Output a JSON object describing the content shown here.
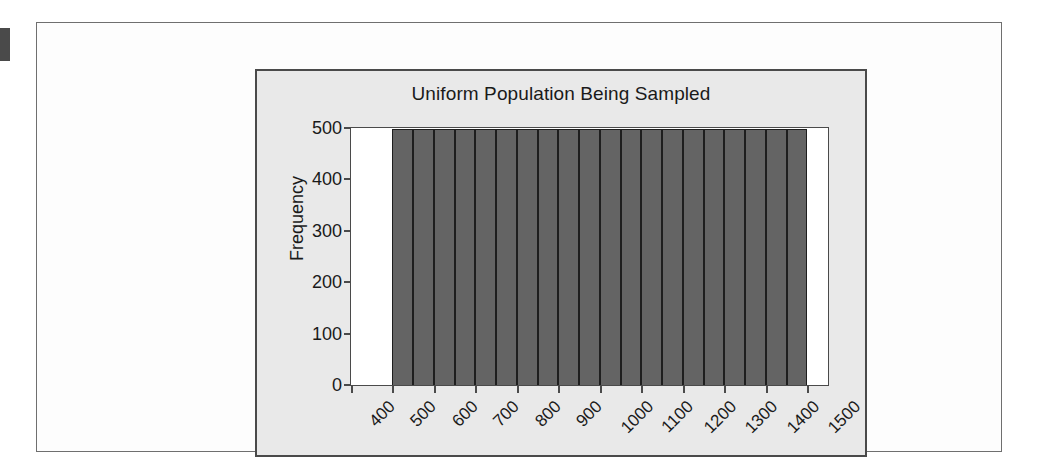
{
  "page": {
    "background_color": "#ffffff",
    "panel_background_color": "#fdfdfd",
    "edge_marker_color": "#4a4a4a"
  },
  "chart_data": {
    "type": "bar",
    "title": "Uniform Population Being Sampled",
    "subtitle": "",
    "xlabel": "",
    "ylabel": "Frequency",
    "xlim": [
      400,
      1550
    ],
    "ylim": [
      0,
      500
    ],
    "grid": false,
    "legend": false,
    "bar_fill_color": "#646464",
    "bar_border_color": "#1e1e1e",
    "plot_background_color": "#ffffff",
    "chart_background_color": "#e9e9e9",
    "bin_width": 50,
    "x_tick_labels": [
      "400",
      "500",
      "600",
      "700",
      "800",
      "900",
      "1000",
      "1100",
      "1200",
      "1300",
      "1400",
      "1500"
    ],
    "x_tick_values": [
      400,
      500,
      600,
      700,
      800,
      900,
      1000,
      1100,
      1200,
      1300,
      1400,
      1500
    ],
    "y_tick_labels": [
      "0",
      "100",
      "200",
      "300",
      "400",
      "500"
    ],
    "y_tick_values": [
      0,
      100,
      200,
      300,
      400,
      500
    ],
    "bins": [
      {
        "x_start": 500,
        "x_end": 550,
        "value": 498
      },
      {
        "x_start": 550,
        "x_end": 600,
        "value": 498
      },
      {
        "x_start": 600,
        "x_end": 650,
        "value": 498
      },
      {
        "x_start": 650,
        "x_end": 700,
        "value": 498
      },
      {
        "x_start": 700,
        "x_end": 750,
        "value": 498
      },
      {
        "x_start": 750,
        "x_end": 800,
        "value": 498
      },
      {
        "x_start": 800,
        "x_end": 850,
        "value": 498
      },
      {
        "x_start": 850,
        "x_end": 900,
        "value": 498
      },
      {
        "x_start": 900,
        "x_end": 950,
        "value": 498
      },
      {
        "x_start": 950,
        "x_end": 1000,
        "value": 498
      },
      {
        "x_start": 1000,
        "x_end": 1050,
        "value": 498
      },
      {
        "x_start": 1050,
        "x_end": 1100,
        "value": 498
      },
      {
        "x_start": 1100,
        "x_end": 1150,
        "value": 498
      },
      {
        "x_start": 1150,
        "x_end": 1200,
        "value": 498
      },
      {
        "x_start": 1200,
        "x_end": 1250,
        "value": 498
      },
      {
        "x_start": 1250,
        "x_end": 1300,
        "value": 498
      },
      {
        "x_start": 1300,
        "x_end": 1350,
        "value": 498
      },
      {
        "x_start": 1350,
        "x_end": 1400,
        "value": 498
      },
      {
        "x_start": 1400,
        "x_end": 1450,
        "value": 498
      },
      {
        "x_start": 1450,
        "x_end": 1500,
        "value": 498
      }
    ],
    "categories": [
      "500-550",
      "550-600",
      "600-650",
      "650-700",
      "700-750",
      "750-800",
      "800-850",
      "850-900",
      "900-950",
      "950-1000",
      "1000-1050",
      "1050-1100",
      "1100-1150",
      "1150-1200",
      "1200-1250",
      "1250-1300",
      "1300-1350",
      "1350-1400",
      "1400-1450",
      "1450-1500"
    ],
    "values": [
      498,
      498,
      498,
      498,
      498,
      498,
      498,
      498,
      498,
      498,
      498,
      498,
      498,
      498,
      498,
      498,
      498,
      498,
      498,
      498
    ]
  }
}
